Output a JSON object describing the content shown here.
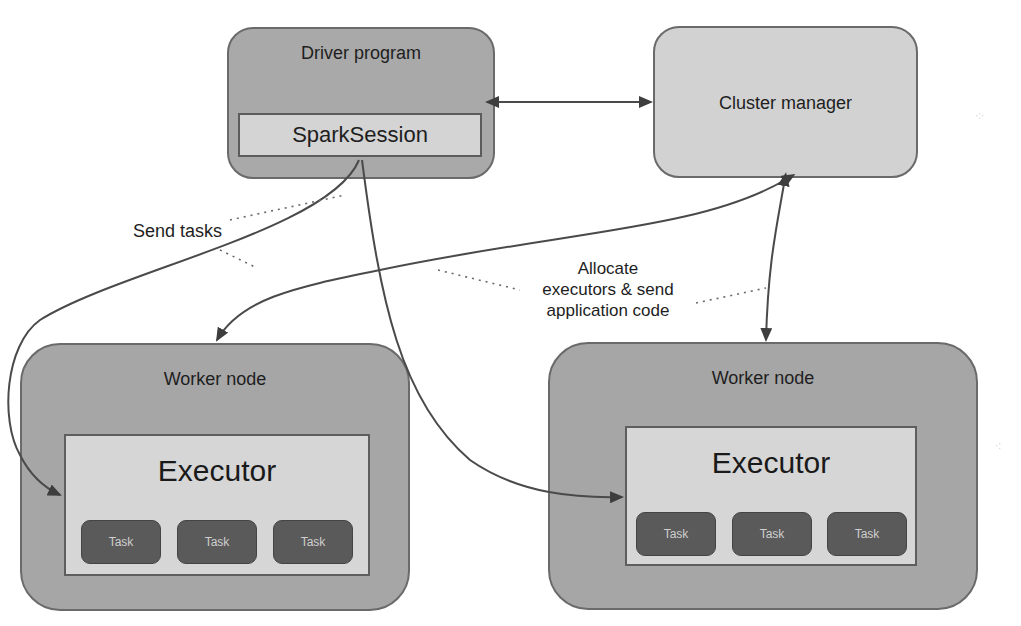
{
  "diagram": {
    "driver": {
      "title": "Driver program",
      "session": "SparkSession"
    },
    "cluster_manager": {
      "title": "Cluster manager"
    },
    "workers": [
      {
        "title": "Worker node",
        "executor": "Executor",
        "tasks": [
          "Task",
          "Task",
          "Task"
        ]
      },
      {
        "title": "Worker node",
        "executor": "Executor",
        "tasks": [
          "Task",
          "Task",
          "Task"
        ]
      }
    ],
    "annotations": {
      "send_tasks": "Send tasks",
      "allocate_line1": "Allocate",
      "allocate_line2": "executors & send",
      "allocate_line3": "application code"
    },
    "edges": [
      {
        "from": "Driver program",
        "to": "Cluster manager",
        "type": "bidirectional"
      },
      {
        "from": "Cluster manager",
        "to": "Worker node (left)",
        "type": "bidirectional"
      },
      {
        "from": "Cluster manager",
        "to": "Worker node (right)",
        "type": "bidirectional"
      },
      {
        "from": "SparkSession",
        "to": "Executor (left)",
        "type": "directed"
      },
      {
        "from": "SparkSession",
        "to": "Executor (right)",
        "type": "directed"
      }
    ],
    "colors": {
      "driver_fill": "#a9a9a9",
      "cluster_fill": "#d2d2d2",
      "worker_fill": "#a6a6a6",
      "executor_fill": "#d6d6d6",
      "task_fill": "#5a5a5a",
      "line": "#4a4a4a"
    }
  }
}
